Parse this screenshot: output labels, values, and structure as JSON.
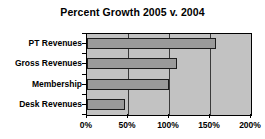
{
  "chart_data": {
    "type": "bar",
    "orientation": "horizontal",
    "title": "Percent Growth 2005 v. 2004",
    "xlabel": "",
    "ylabel": "",
    "categories": [
      "PT Revenues",
      "Gross Revenues",
      "Membership",
      "Desk Revenues"
    ],
    "values": [
      157,
      110,
      100,
      46
    ],
    "value_unit": "%",
    "xlim": [
      0,
      200
    ],
    "xticks": [
      0,
      50,
      100,
      150,
      200
    ],
    "xtick_labels": [
      "0%",
      "50%",
      "100%",
      "150%",
      "200%"
    ],
    "grid": true,
    "grid_axis": "x",
    "legend": false,
    "colors": {
      "bar_fill": "#9a9a9a",
      "bar_border": "#1c1c1c",
      "plot_background": "#c2c2c2",
      "gridline": "#3a3a3a",
      "axis": "#000000",
      "text": "#000000",
      "figure_background": "#ffffff"
    }
  }
}
